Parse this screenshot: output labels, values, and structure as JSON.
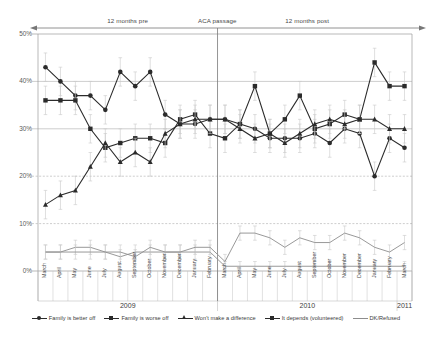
{
  "annotations": {
    "pre": "12 months pre",
    "event": "ACA passage",
    "post": "12 months post"
  },
  "axis": {
    "y_ticks": [
      "0%",
      "10%",
      "20%",
      "30%",
      "40%",
      "50%"
    ],
    "years": [
      "2009",
      "2010",
      "2011"
    ]
  },
  "caption": "",
  "chart_data": {
    "type": "line",
    "title": "",
    "xlabel": "",
    "ylabel": "",
    "ylim": [
      0,
      50
    ],
    "grid": true,
    "legend_position": "bottom",
    "annotations": [
      {
        "text": "12 months pre",
        "x": "2009-09"
      },
      {
        "text": "ACA passage",
        "x": "2010-03"
      },
      {
        "text": "12 months post",
        "x": "2010-09"
      }
    ],
    "vline": {
      "label": "ACA passage",
      "x": "2010-03"
    },
    "x": [
      "March 2009",
      "April 2009",
      "May 2009",
      "June 2009",
      "July 2009",
      "August 2009",
      "September 2009",
      "October 2009",
      "November 2009",
      "December 2009",
      "January 2010",
      "February 2010",
      "March 2010",
      "April 2010",
      "May 2010",
      "June 2010",
      "July 2010",
      "August 2010",
      "September 2010",
      "October 2010",
      "November 2010",
      "December 2010",
      "January 2011",
      "February 2011",
      "March 2011"
    ],
    "categories": [
      "March",
      "April",
      "May",
      "June",
      "July",
      "August",
      "September",
      "October",
      "November",
      "December",
      "January",
      "February",
      "March",
      "April",
      "May",
      "June",
      "July",
      "August",
      "September",
      "October",
      "November",
      "December",
      "January",
      "February",
      "March"
    ],
    "series": [
      {
        "name": "Family is better off",
        "marker": "circle",
        "color": "#2b2b2b",
        "values": [
          43,
          40,
          37,
          37,
          34,
          42,
          39,
          42,
          33,
          31,
          31,
          32,
          32,
          31,
          30,
          28,
          28,
          28,
          29,
          27,
          30,
          29,
          20,
          28,
          26
        ],
        "errors": [
          3,
          3,
          3,
          3,
          3,
          3,
          3,
          3,
          3,
          3,
          3,
          3,
          3,
          3,
          3,
          3,
          3,
          3,
          3,
          3,
          3,
          3,
          3,
          3,
          3
        ]
      },
      {
        "name": "Family is worse off",
        "marker": "square",
        "color": "#2b2b2b",
        "values": [
          36,
          36,
          36,
          30,
          26,
          27,
          28,
          28,
          27,
          32,
          33,
          29,
          28,
          31,
          39,
          29,
          32,
          37,
          30,
          31,
          33,
          32,
          44,
          39,
          39
        ],
        "errors": [
          3,
          3,
          3,
          3,
          3,
          3,
          3,
          3,
          3,
          3,
          3,
          3,
          3,
          3,
          3,
          3,
          3,
          3,
          3,
          3,
          3,
          3,
          3,
          3,
          3
        ]
      },
      {
        "name": "Won't make a difference",
        "marker": "triangle",
        "color": "#2b2b2b",
        "values": [
          14,
          16,
          17,
          22,
          27,
          23,
          25,
          23,
          29,
          31,
          32,
          32,
          32,
          30,
          28,
          29,
          27,
          29,
          31,
          32,
          31,
          32,
          32,
          30,
          30
        ],
        "errors": [
          3,
          3,
          3,
          3,
          3,
          3,
          3,
          3,
          3,
          3,
          3,
          3,
          3,
          3,
          3,
          3,
          3,
          3,
          3,
          3,
          3,
          3,
          3,
          3,
          3
        ]
      },
      {
        "name": "It depends (volunteered)",
        "marker": "none",
        "color": "#8d8d8d",
        "values": [
          4,
          4,
          5,
          5,
          4,
          3,
          4,
          4,
          4,
          4,
          4,
          4,
          1,
          1,
          1,
          1,
          1,
          1,
          1,
          1,
          1,
          1,
          1,
          1,
          1
        ],
        "errors": [
          1.5,
          1.5,
          1.5,
          1.5,
          1.5,
          1.5,
          1.5,
          1.5,
          1.5,
          1.5,
          1.5,
          1.5,
          1,
          1,
          1,
          1,
          1,
          1,
          1,
          1,
          1,
          1,
          1,
          1,
          1
        ]
      },
      {
        "name": "DK/Refused",
        "marker": "none",
        "color": "#8d8d8d",
        "values": [
          4,
          4,
          4,
          4,
          4,
          4,
          3,
          5,
          4,
          4,
          5,
          5,
          2,
          8,
          8,
          7,
          5,
          7,
          6,
          6,
          8,
          7,
          5,
          4,
          6
        ],
        "errors": [
          1.5,
          1.5,
          1.5,
          1.5,
          1.5,
          1.5,
          1.5,
          1.5,
          1.5,
          1.5,
          1.5,
          1.5,
          1.5,
          1.5,
          1.5,
          1.5,
          1.5,
          1.5,
          1.5,
          1.5,
          1.5,
          1.5,
          1.5,
          1.5,
          1.5
        ]
      }
    ]
  },
  "legend": [
    {
      "label": "Family is better off",
      "marker": "circle",
      "color": "#2b2b2b"
    },
    {
      "label": "Family is worse off",
      "marker": "square",
      "color": "#2b2b2b"
    },
    {
      "label": "Won't make a difference",
      "marker": "triangle",
      "color": "#2b2b2b"
    },
    {
      "label": "It depends (volunteered)",
      "marker": "square",
      "color": "#2b2b2b"
    },
    {
      "label": "DK/Refused",
      "marker": "none",
      "color": "#8d8d8d"
    }
  ]
}
